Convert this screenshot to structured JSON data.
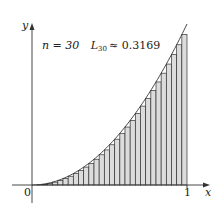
{
  "chart_data": {
    "type": "area",
    "title": "",
    "function": "y = x^2",
    "annotation": {
      "n_label": "n = 30",
      "approx_label": "L",
      "approx_subscript": "30",
      "approx_value": "≈ 0.3169",
      "n": 30,
      "L30": 0.3169
    },
    "xlabel": "x",
    "ylabel": "y",
    "x_ticks": [
      "0",
      "1"
    ],
    "xlim": [
      0,
      1
    ],
    "ylim": [
      0,
      1
    ],
    "method": "left endpoint rectangles",
    "grid": false,
    "colors": {
      "rect_fill": "#dcdcdc",
      "rect_stroke": "#333333",
      "curve": "#333333",
      "axis": "#333333"
    }
  }
}
